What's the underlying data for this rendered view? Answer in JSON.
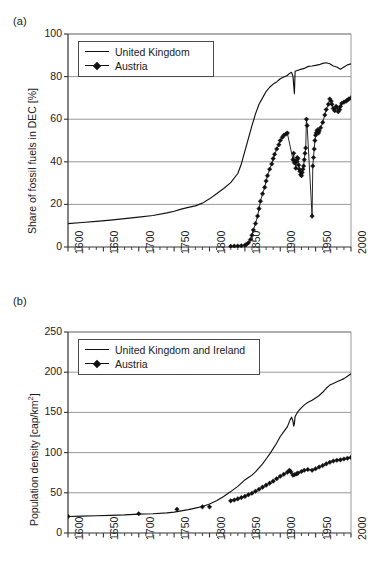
{
  "figure": {
    "panel_a_label": "(a)",
    "panel_b_label": "(b)"
  },
  "chart_data": [
    {
      "id": "panel-a",
      "type": "line",
      "title": "",
      "panel_label": "(a)",
      "xlabel": "",
      "ylabel": "Share of fossil fuels in DEC [%]",
      "xlim": [
        1600,
        2000
      ],
      "ylim": [
        0,
        100
      ],
      "xticks": [
        1600,
        1650,
        1700,
        1750,
        1800,
        1850,
        1900,
        1950,
        2000
      ],
      "yticks": [
        0,
        20,
        40,
        60,
        80,
        100
      ],
      "xtick_labels": [
        "1600",
        "1650",
        "1700",
        "1750",
        "1800",
        "1850",
        "1900",
        "1950",
        "2000"
      ],
      "ytick_labels": [
        "0",
        "20",
        "40",
        "60",
        "80",
        "100"
      ],
      "minor_xtick_step": 10,
      "grid": "horizontal",
      "legend_position": "top-left",
      "series": [
        {
          "name": "United Kingdom",
          "style": "line",
          "color": "#111111",
          "x": [
            1600,
            1620,
            1640,
            1660,
            1680,
            1700,
            1720,
            1740,
            1750,
            1760,
            1770,
            1780,
            1790,
            1800,
            1810,
            1820,
            1830,
            1840,
            1845,
            1850,
            1855,
            1860,
            1865,
            1870,
            1875,
            1880,
            1885,
            1890,
            1895,
            1900,
            1905,
            1910,
            1913,
            1916,
            1918,
            1920,
            1921,
            1925,
            1930,
            1935,
            1940,
            1945,
            1950,
            1955,
            1960,
            1965,
            1970,
            1975,
            1980,
            1985,
            1990,
            1995,
            2000
          ],
          "y": [
            11.0,
            11.5,
            12.0,
            12.6,
            13.3,
            14.0,
            14.8,
            16.0,
            16.8,
            17.8,
            18.6,
            19.3,
            20.6,
            22.6,
            25.0,
            27.5,
            30.2,
            34.5,
            39.0,
            45.0,
            51.0,
            57.0,
            62.5,
            67.0,
            70.0,
            73.0,
            75.0,
            76.5,
            77.5,
            79.0,
            79.8,
            80.5,
            81.5,
            82.0,
            80.0,
            72.0,
            82.5,
            83.0,
            83.5,
            84.0,
            84.8,
            85.0,
            85.3,
            85.6,
            86.2,
            86.5,
            86.0,
            85.0,
            84.5,
            83.5,
            84.5,
            85.5,
            86.0
          ]
        },
        {
          "name": "Austria",
          "style": "line-markers",
          "marker": "diamond",
          "color": "#111111",
          "x": [
            1830,
            1835,
            1840,
            1845,
            1850,
            1852,
            1855,
            1858,
            1860,
            1862,
            1865,
            1868,
            1870,
            1872,
            1875,
            1878,
            1880,
            1882,
            1885,
            1888,
            1890,
            1892,
            1895,
            1898,
            1900,
            1903,
            1905,
            1908,
            1910,
            1918,
            1919,
            1920,
            1921,
            1922,
            1923,
            1924,
            1925,
            1926,
            1927,
            1928,
            1929,
            1930,
            1931,
            1932,
            1933,
            1934,
            1935,
            1936,
            1937,
            1938,
            1945,
            1946,
            1947,
            1948,
            1949,
            1950,
            1951,
            1952,
            1953,
            1954,
            1955,
            1957,
            1960,
            1963,
            1965,
            1968,
            1970,
            1972,
            1973,
            1975,
            1977,
            1979,
            1980,
            1982,
            1984,
            1985,
            1987,
            1990,
            1993,
            1995,
            1997,
            2000
          ],
          "y": [
            0.3,
            0.4,
            0.5,
            0.6,
            0.8,
            1.2,
            2.0,
            3.5,
            5.5,
            8.0,
            11.0,
            14.5,
            18.0,
            21.5,
            25.0,
            28.0,
            31.0,
            33.5,
            36.5,
            39.0,
            41.5,
            43.5,
            46.0,
            48.0,
            50.0,
            51.5,
            52.5,
            53.0,
            53.5,
            41.0,
            44.0,
            39.5,
            40.5,
            37.0,
            40.0,
            42.0,
            41.5,
            38.5,
            36.5,
            35.5,
            34.0,
            33.5,
            35.0,
            36.5,
            38.0,
            41.0,
            44.0,
            46.5,
            60.0,
            57.0,
            14.5,
            38.0,
            42.0,
            46.0,
            50.0,
            52.5,
            53.5,
            54.5,
            55.0,
            53.5,
            54.5,
            56.0,
            58.5,
            62.0,
            64.5,
            67.0,
            69.5,
            68.5,
            67.0,
            65.0,
            64.0,
            66.0,
            65.5,
            63.5,
            64.5,
            66.0,
            67.5,
            68.0,
            68.5,
            69.0,
            69.5,
            70.0
          ]
        }
      ]
    },
    {
      "id": "panel-b",
      "type": "line",
      "title": "",
      "panel_label": "(b)",
      "xlabel": "",
      "ylabel": "Population density [cap/km2]",
      "ylabel_parts": [
        "Population density [cap/km",
        "2",
        "]"
      ],
      "xlim": [
        1600,
        2000
      ],
      "ylim": [
        0,
        250
      ],
      "xticks": [
        1600,
        1650,
        1700,
        1750,
        1800,
        1850,
        1900,
        1950,
        2000
      ],
      "yticks": [
        0,
        50,
        100,
        150,
        200,
        250
      ],
      "xtick_labels": [
        "1600",
        "1650",
        "1700",
        "1750",
        "1800",
        "1850",
        "1900",
        "1950",
        "2000"
      ],
      "ytick_labels": [
        "0",
        "50",
        "100",
        "150",
        "200",
        "250"
      ],
      "minor_xtick_step": 10,
      "grid": "horizontal",
      "legend_position": "top-left",
      "series": [
        {
          "name": "United Kingdom and Ireland",
          "style": "line",
          "color": "#111111",
          "x": [
            1600,
            1620,
            1640,
            1660,
            1680,
            1700,
            1720,
            1740,
            1750,
            1760,
            1770,
            1780,
            1790,
            1800,
            1810,
            1820,
            1830,
            1840,
            1845,
            1850,
            1855,
            1860,
            1865,
            1870,
            1875,
            1880,
            1885,
            1890,
            1895,
            1900,
            1905,
            1910,
            1914,
            1916,
            1918,
            1919,
            1920,
            1921,
            1923,
            1925,
            1930,
            1935,
            1940,
            1945,
            1950,
            1955,
            1960,
            1965,
            1970,
            1975,
            1980,
            1985,
            1990,
            1995,
            2000
          ],
          "y": [
            20.5,
            21.0,
            21.5,
            22.0,
            22.5,
            23.5,
            24.0,
            25.0,
            26.0,
            27.5,
            29.0,
            31.0,
            33.0,
            36.0,
            40.0,
            45.5,
            51.5,
            58.0,
            62.0,
            66.0,
            69.0,
            72.0,
            76.0,
            81.0,
            86.0,
            92.0,
            98.0,
            105.0,
            112.0,
            120.0,
            126.0,
            132.0,
            141.0,
            144.0,
            139.0,
            133.0,
            136.0,
            145.0,
            148.0,
            151.0,
            156.0,
            160.0,
            163.0,
            165.0,
            168.0,
            171.0,
            175.0,
            180.0,
            184.0,
            186.0,
            188.0,
            190.0,
            192.0,
            195.0,
            198.0
          ]
        },
        {
          "name": "Austria",
          "style": "line-markers",
          "marker": "diamond",
          "color": "#111111",
          "x": [
            1830,
            1835,
            1840,
            1845,
            1850,
            1855,
            1860,
            1865,
            1870,
            1875,
            1880,
            1885,
            1890,
            1895,
            1900,
            1905,
            1910,
            1913,
            1915,
            1918,
            1920,
            1923,
            1925,
            1930,
            1934,
            1939,
            1945,
            1950,
            1955,
            1960,
            1965,
            1970,
            1975,
            1980,
            1985,
            1990,
            1995,
            2000
          ],
          "y": [
            40.0,
            41.0,
            42.5,
            44.0,
            45.5,
            47.5,
            49.5,
            52.0,
            54.5,
            57.0,
            59.5,
            62.0,
            64.5,
            67.5,
            70.5,
            73.0,
            75.5,
            78.0,
            76.0,
            72.0,
            72.5,
            73.5,
            74.5,
            76.5,
            78.0,
            79.0,
            78.0,
            80.0,
            82.0,
            84.0,
            86.0,
            88.0,
            89.5,
            90.5,
            91.0,
            92.0,
            93.0,
            94.0
          ]
        },
        {
          "name": "Austria isolated",
          "style": "markers",
          "marker": "diamond",
          "color": "#111111",
          "x": [
            1600,
            1700,
            1754,
            1790,
            1800
          ],
          "y": [
            20.5,
            24.0,
            29.5,
            32.5,
            32.5
          ]
        }
      ]
    }
  ]
}
